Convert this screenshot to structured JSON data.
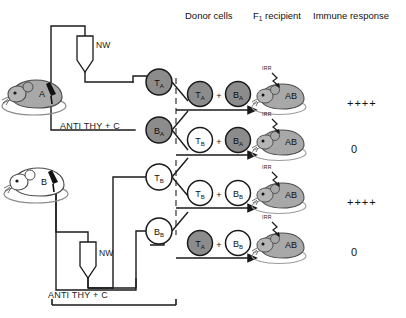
{
  "figure": {
    "columns": {
      "donor_cells": "Donor cells",
      "f1_recipient_main": "F",
      "f1_recipient_sub": "1",
      "f1_recipient_rest": " recipient",
      "immune_response": "Immune response"
    },
    "source_mice": [
      {
        "label": "A",
        "fill": "gray",
        "column_label": "NW",
        "treatment": "ANTI THY + C"
      },
      {
        "label": "B",
        "fill": "white",
        "column_label": "NW",
        "treatment": "ANTI THY + C"
      }
    ],
    "separated_cells": [
      {
        "main": "T",
        "sub": "A",
        "fill": "gray"
      },
      {
        "main": "B",
        "sub": "A",
        "fill": "gray"
      },
      {
        "main": "T",
        "sub": "B",
        "fill": "white"
      },
      {
        "main": "B",
        "sub": "B",
        "fill": "white"
      }
    ],
    "rows": [
      {
        "donor": [
          {
            "main": "T",
            "sub": "A",
            "fill": "gray"
          },
          {
            "main": "B",
            "sub": "A",
            "fill": "gray"
          }
        ],
        "plus": "+",
        "irr_label": "IRR",
        "recipient_label": "AB",
        "response": "++++"
      },
      {
        "donor": [
          {
            "main": "T",
            "sub": "B",
            "fill": "white"
          },
          {
            "main": "B",
            "sub": "A",
            "fill": "gray"
          }
        ],
        "plus": "+",
        "irr_label": "IRR",
        "recipient_label": "AB",
        "response": "0"
      },
      {
        "donor": [
          {
            "main": "T",
            "sub": "B",
            "fill": "white"
          },
          {
            "main": "B",
            "sub": "B",
            "fill": "white"
          }
        ],
        "plus": "+",
        "irr_label": "IRR",
        "recipient_label": "AB",
        "response": "++++"
      },
      {
        "donor": [
          {
            "main": "T",
            "sub": "A",
            "fill": "gray"
          },
          {
            "main": "B",
            "sub": "B",
            "fill": "white"
          }
        ],
        "plus": "+",
        "irr_label": "IRR",
        "recipient_label": "AB",
        "response": "0"
      }
    ],
    "colors": {
      "gray_fill": "#8c8c8c",
      "white_fill": "#ffffff",
      "line": "#1a1a1a",
      "mouse_gray": "#a8a8a8",
      "mouse_outline": "#4d4d4d"
    }
  }
}
